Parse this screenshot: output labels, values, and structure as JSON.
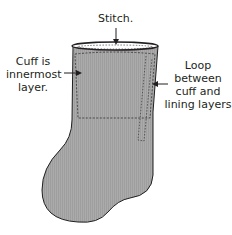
{
  "diagram": {
    "labels": {
      "stitch": "Stitch.",
      "cuff_line1": "Cuff is",
      "cuff_line2": "innermost",
      "cuff_line3": "layer.",
      "loop_line1": "Loop",
      "loop_line2": "between",
      "loop_line3": "cuff and",
      "loop_line4": "lining layers"
    },
    "colors": {
      "fill": "#a9a9a9",
      "outline": "#231f20",
      "background": "#ffffff"
    }
  }
}
